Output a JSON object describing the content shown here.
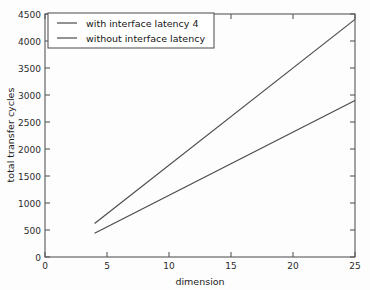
{
  "chart_data": {
    "type": "line",
    "title": "",
    "xlabel": "dimension",
    "ylabel": "total transfer cycles",
    "xlim": [
      0,
      25
    ],
    "ylim": [
      0,
      4500
    ],
    "xticks": [
      0,
      5,
      10,
      15,
      20,
      25
    ],
    "yticks": [
      0,
      500,
      1000,
      1500,
      2000,
      2500,
      3000,
      3500,
      4000,
      4500
    ],
    "grid": false,
    "legend_position": "upper left",
    "x": [
      4,
      25
    ],
    "series": [
      {
        "name": "with interface latency 4",
        "color": "#4a4a4a",
        "values": [
          620,
          4400
        ]
      },
      {
        "name": "without interface latency",
        "color": "#4a4a4a",
        "values": [
          440,
          2900
        ]
      }
    ]
  },
  "legend": {
    "entries": [
      {
        "label": "with interface latency 4"
      },
      {
        "label": "without interface latency"
      }
    ]
  },
  "axes": {
    "x_title": "dimension",
    "y_title": "total transfer cycles",
    "x_tick_labels": [
      "0",
      "5",
      "10",
      "15",
      "20",
      "25"
    ],
    "y_tick_labels": [
      "0",
      "500",
      "1000",
      "1500",
      "2000",
      "2500",
      "3000",
      "3500",
      "4000",
      "4500"
    ]
  }
}
